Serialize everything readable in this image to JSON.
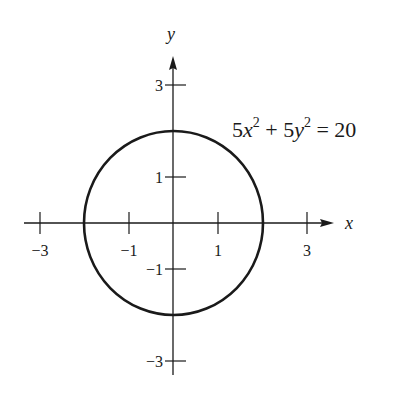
{
  "chart_data": {
    "type": "diagram",
    "title": "",
    "equation": "5x^2 + 5y^2 = 20",
    "shape": {
      "kind": "circle",
      "center": [
        0,
        0
      ],
      "radius": 2
    },
    "xlabel": "x",
    "ylabel": "y",
    "xlim": [
      -3.5,
      3.7
    ],
    "ylim": [
      -3.3,
      3.5
    ],
    "x_ticks": [
      -3,
      -1,
      1,
      3
    ],
    "x_tick_labels": [
      "−3",
      "−1",
      "1",
      "3"
    ],
    "y_ticks": [
      3,
      1,
      -1,
      -3
    ],
    "y_tick_labels": [
      "3",
      "1",
      "−1",
      "−3"
    ],
    "grid": false
  },
  "labels": {
    "x_axis": "x",
    "y_axis": "y",
    "eq_5x": "5x",
    "eq_plus_5y": " + 5y",
    "eq_rhs": " = 20",
    "eq_exp": "2"
  },
  "colors": {
    "ink": "#1a1a1a",
    "background": "#ffffff"
  }
}
